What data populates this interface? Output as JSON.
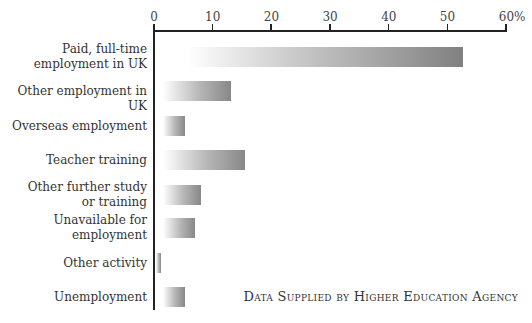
{
  "chart_data": {
    "type": "bar",
    "orientation": "horizontal",
    "title": "",
    "xlabel": "",
    "ylabel": "",
    "xlim": [
      0,
      60
    ],
    "x_ticks": [
      "0",
      "10",
      "20",
      "30",
      "40",
      "50",
      "60%"
    ],
    "x_tick_values": [
      0,
      10,
      20,
      30,
      40,
      50,
      60
    ],
    "axis_position": "top",
    "grid": false,
    "categories": [
      "Paid, full-time\nemployment in UK",
      "Other employment in UK",
      "Overseas employment",
      "Teacher training",
      "Other further study\nor training",
      "Unavailable for\nemployment",
      "Other activity",
      "Unemployment"
    ],
    "values": [
      52.6,
      13.2,
      5.2,
      15.5,
      8.0,
      6.9,
      1.2,
      5.2
    ],
    "unit": "%",
    "bar_style": "horizontal gradient white to gray",
    "bar_color_end": "#808080",
    "annotation": "Data Supplied by Higher Education Agency"
  }
}
